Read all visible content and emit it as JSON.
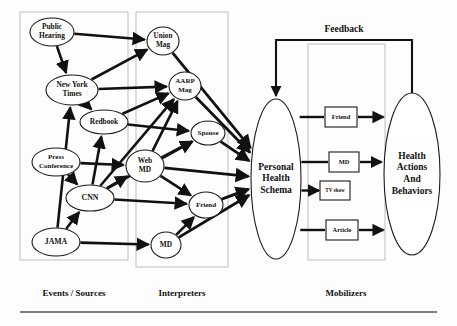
{
  "figure": {
    "background_color": "#fdfdfd",
    "line_color": "#111111",
    "region_border_color": "#b9b9b9"
  },
  "feedback": {
    "label": "Feedback"
  },
  "regions": [
    {
      "id": "events-sources",
      "label": "Events / Sources",
      "x": 20,
      "y": 12,
      "w": 108,
      "h": 248,
      "label_x": 74,
      "label_y": 296
    },
    {
      "id": "interpreters",
      "label": "Interpreters",
      "x": 136,
      "y": 12,
      "w": 92,
      "h": 255,
      "label_x": 182,
      "label_y": 296
    },
    {
      "id": "mobilizers",
      "label": "Mobilizers",
      "x": 308,
      "y": 44,
      "w": 77,
      "h": 216,
      "label_x": 346,
      "label_y": 296
    }
  ],
  "nodes": [
    {
      "id": "public-hearing",
      "label": "Public Hearing",
      "lines": [
        "Public",
        "Hearing"
      ],
      "shape": "ellipse",
      "cx": 52,
      "cy": 32,
      "rx": 22,
      "ry": 14,
      "font_size": 7.4,
      "group": "events-sources"
    },
    {
      "id": "new-york-times",
      "label": "New York Times",
      "lines": [
        "New York",
        "Times"
      ],
      "shape": "ellipse",
      "cx": 72,
      "cy": 90,
      "rx": 26,
      "ry": 15,
      "font_size": 7.4,
      "group": "events-sources"
    },
    {
      "id": "redbook",
      "label": "Redbook",
      "lines": [
        "Redbook"
      ],
      "shape": "ellipse",
      "cx": 104,
      "cy": 122,
      "rx": 24,
      "ry": 12,
      "font_size": 7.4,
      "group": "events-sources"
    },
    {
      "id": "press-conference",
      "label": "Press Conference",
      "lines": [
        "Press",
        "Conference"
      ],
      "shape": "ellipse",
      "cx": 56,
      "cy": 162,
      "rx": 24,
      "ry": 14,
      "font_size": 7.0,
      "group": "events-sources"
    },
    {
      "id": "cnn",
      "label": "CNN",
      "lines": [
        "CNN"
      ],
      "shape": "ellipse",
      "cx": 90,
      "cy": 198,
      "rx": 24,
      "ry": 13,
      "font_size": 7.8,
      "group": "events-sources"
    },
    {
      "id": "jama",
      "label": "JAMA",
      "lines": [
        "JAMA"
      ],
      "shape": "ellipse",
      "cx": 56,
      "cy": 242,
      "rx": 24,
      "ry": 14,
      "font_size": 7.8,
      "group": "events-sources"
    },
    {
      "id": "union-mag",
      "label": "Union Mag",
      "lines": [
        "Union",
        "Mag"
      ],
      "shape": "ellipse",
      "cx": 163,
      "cy": 41,
      "rx": 16,
      "ry": 14,
      "font_size": 7.2,
      "group": "interpreters"
    },
    {
      "id": "aarp-mag",
      "label": "AARP Mag",
      "lines": [
        "AARP",
        "Mag"
      ],
      "shape": "ellipse",
      "cx": 185,
      "cy": 86,
      "rx": 16,
      "ry": 14,
      "font_size": 7.0,
      "group": "interpreters"
    },
    {
      "id": "spouse",
      "label": "Spouse",
      "lines": [
        "Spouse"
      ],
      "shape": "ellipse",
      "cx": 208,
      "cy": 133,
      "rx": 17,
      "ry": 12,
      "font_size": 7.0,
      "group": "interpreters"
    },
    {
      "id": "web-md",
      "label": "Web MD",
      "lines": [
        "Web",
        "MD"
      ],
      "shape": "ellipse",
      "cx": 145,
      "cy": 166,
      "rx": 19,
      "ry": 16,
      "font_size": 7.4,
      "group": "interpreters"
    },
    {
      "id": "friend-node",
      "label": "Friend",
      "lines": [
        "Friend"
      ],
      "shape": "ellipse",
      "cx": 206,
      "cy": 205,
      "rx": 17,
      "ry": 13,
      "font_size": 7.0,
      "group": "interpreters"
    },
    {
      "id": "md-node",
      "label": "MD",
      "lines": [
        "MD"
      ],
      "shape": "ellipse",
      "cx": 166,
      "cy": 245,
      "rx": 15,
      "ry": 13,
      "font_size": 7.4,
      "group": "interpreters"
    },
    {
      "id": "personal-health-schema",
      "label": "Personal Health Schema",
      "lines": [
        "Personal",
        "Health",
        "Schema"
      ],
      "shape": "ellipse",
      "cx": 276,
      "cy": 179,
      "rx": 25,
      "ry": 80,
      "font_size": 9.5,
      "group": "core"
    },
    {
      "id": "health-actions",
      "label": "Health Actions And Behaviors",
      "lines": [
        "Health",
        "Actions",
        "And",
        "Behaviors"
      ],
      "shape": "ellipse",
      "cx": 412,
      "cy": 174,
      "rx": 28,
      "ry": 81,
      "font_size": 9.5,
      "group": "core"
    }
  ],
  "mobilizers": [
    {
      "id": "mobilizer-friend",
      "label": "Friend",
      "x": 325,
      "y": 107,
      "w": 32,
      "h": 20,
      "font_size": 6.4,
      "has_outgoing": true
    },
    {
      "id": "mobilizer-md",
      "label": "MD",
      "x": 329,
      "y": 152,
      "w": 30,
      "h": 20,
      "font_size": 6.4,
      "has_outgoing": true
    },
    {
      "id": "mobilizer-tvshow",
      "label": "TV show",
      "x": 320,
      "y": 181,
      "w": 30,
      "h": 19,
      "font_size": 5.2,
      "has_outgoing": false
    },
    {
      "id": "mobilizer-article",
      "label": "Article",
      "x": 326,
      "y": 220,
      "w": 32,
      "h": 20,
      "font_size": 6.4,
      "has_outgoing": true
    }
  ],
  "edges": [
    {
      "from": "public-hearing",
      "to": "union-mag",
      "weight": 2.6
    },
    {
      "from": "public-hearing",
      "to": "new-york-times",
      "weight": 2.6
    },
    {
      "from": "new-york-times",
      "to": "union-mag",
      "weight": 2.6
    },
    {
      "from": "new-york-times",
      "to": "aarp-mag",
      "weight": 2.6
    },
    {
      "from": "new-york-times",
      "to": "redbook",
      "weight": 2.6
    },
    {
      "from": "redbook",
      "to": "aarp-mag",
      "weight": 2.6
    },
    {
      "from": "redbook",
      "to": "spouse",
      "weight": 2.6
    },
    {
      "from": "press-conference",
      "to": "cnn",
      "weight": 2.6
    },
    {
      "from": "press-conference",
      "to": "web-md",
      "weight": 2.6
    },
    {
      "from": "cnn",
      "to": "redbook",
      "weight": 2.6
    },
    {
      "from": "cnn",
      "to": "aarp-mag",
      "weight": 2.6
    },
    {
      "from": "cnn",
      "to": "web-md",
      "weight": 2.6
    },
    {
      "from": "cnn",
      "to": "spouse",
      "weight": 2.6
    },
    {
      "from": "cnn",
      "to": "friend-node",
      "weight": 2.6
    },
    {
      "from": "jama",
      "to": "new-york-times",
      "weight": 2.6
    },
    {
      "from": "jama",
      "to": "cnn",
      "weight": 2.6
    },
    {
      "from": "jama",
      "to": "md-node",
      "weight": 2.6
    },
    {
      "from": "web-md",
      "to": "aarp-mag",
      "weight": 2.6
    },
    {
      "from": "web-md",
      "to": "spouse",
      "weight": 2.6
    },
    {
      "from": "web-md",
      "to": "friend-node",
      "weight": 2.6
    },
    {
      "from": "md-node",
      "to": "friend-node",
      "weight": 2.6
    },
    {
      "from": "union-mag",
      "to": "personal-health-schema",
      "weight": 2.8
    },
    {
      "from": "aarp-mag",
      "to": "personal-health-schema",
      "weight": 2.8
    },
    {
      "from": "spouse",
      "to": "personal-health-schema",
      "weight": 2.8
    },
    {
      "from": "web-md",
      "to": "personal-health-schema",
      "weight": 2.8
    },
    {
      "from": "friend-node",
      "to": "personal-health-schema",
      "weight": 2.8
    },
    {
      "from": "md-node",
      "to": "personal-health-schema",
      "weight": 2.8
    }
  ],
  "baseline_rule": {
    "x1": 20,
    "x2": 437,
    "y": 312
  }
}
